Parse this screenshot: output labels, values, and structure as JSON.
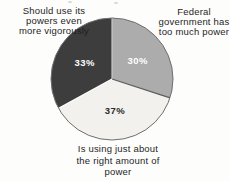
{
  "chart_data": {
    "type": "pie",
    "title": "",
    "start_angle_deg": 0,
    "direction": "clockwise",
    "legend_position": "labels-around-pie",
    "outline_color": "#6e6e6e",
    "slices": [
      {
        "id": "too-much-power",
        "label": "Federal government has too much power",
        "value": 30,
        "pct_text": "30%",
        "color": "#acacac",
        "pct_color": "#ffffff",
        "edge_color": "#c9c9c9"
      },
      {
        "id": "right-amount",
        "label": "Is using just about the right amount of power",
        "value": 37,
        "pct_text": "37%",
        "color": "#f2f1ed",
        "pct_color": "#2b2b2b",
        "edge_color": "#5a5a5a"
      },
      {
        "id": "use-more-vigorously",
        "label": "Should use its powers even more vigorously",
        "value": 33,
        "pct_text": "33%",
        "color": "#3d3d3d",
        "pct_color": "#ffffff",
        "edge_color": "#ffffff"
      }
    ],
    "external_labels": [
      {
        "id": "too-much-power",
        "lines": "Federal\ngovernment has\ntoo much power"
      },
      {
        "id": "right-amount",
        "lines": "Is using just about\nthe right amount of\npower"
      },
      {
        "id": "use-more-vigorously",
        "lines": "Should use its\npowers even\nmore vigorously"
      }
    ]
  }
}
